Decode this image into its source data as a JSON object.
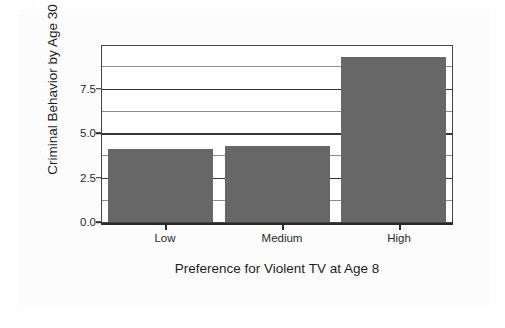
{
  "chart_data": {
    "type": "bar",
    "title": "",
    "subtitle": "",
    "xlabel": "Preference for Violent TV at Age 8",
    "ylabel": "Criminal Behavior by Age 30",
    "categories": [
      "Low",
      "Medium",
      "High"
    ],
    "values": [
      4.1,
      4.3,
      9.3
    ],
    "series": [
      {
        "name": "Criminal Behavior by Age 30",
        "values": [
          4.1,
          4.3,
          9.3
        ]
      }
    ],
    "ylim": [
      0,
      9.9
    ],
    "xlim": [
      0,
      3
    ],
    "ytick_labels": [
      "0.0",
      "2.5",
      "5.0",
      "7.5"
    ],
    "ytick_values": [
      0.0,
      2.5,
      5.0,
      7.5
    ],
    "minor_gridline_values": [
      1.25,
      3.75,
      6.25,
      8.75
    ],
    "grid": "horizontal",
    "legend": "none",
    "legend_position": "none",
    "bar_color": "#676767",
    "axis_color": "#2a2a2a",
    "major_grid_color": "#383838",
    "minor_grid_color": "#8d8d8d",
    "plot_background": "#ffffff",
    "figure_background": "#fcfcfc",
    "annotations": []
  }
}
